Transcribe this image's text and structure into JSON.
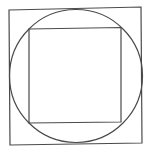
{
  "diagram": {
    "stroke_color": "#4a4a4a",
    "background": "#ffffff",
    "shapes": [
      {
        "id": "outer-square",
        "type": "polygon",
        "points": "9,10 141,7 142,143 10,145"
      },
      {
        "id": "circle",
        "type": "circle",
        "cx": 76,
        "cy": 76,
        "r": 66.5
      },
      {
        "id": "inner-square",
        "type": "polygon",
        "points": "29,29 121,27.5 121,122 29,123"
      }
    ]
  }
}
